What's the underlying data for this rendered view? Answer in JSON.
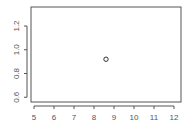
{
  "chart_data": {
    "type": "scatter",
    "title": "",
    "xlabel": "",
    "ylabel": "",
    "xlim": [
      4.85,
      12.35
    ],
    "ylim": [
      0.56,
      1.36
    ],
    "x_ticks": [
      "5",
      "6",
      "7",
      "8",
      "9",
      "10",
      "11",
      "12"
    ],
    "y_ticks": [
      "0.6",
      "0.8",
      "1.0",
      "1.2"
    ],
    "grid": false,
    "legend": null,
    "series": [
      {
        "name": "points",
        "x": [
          8.6
        ],
        "y": [
          0.92
        ],
        "marker": "open-circle",
        "color": "#333333"
      }
    ]
  }
}
